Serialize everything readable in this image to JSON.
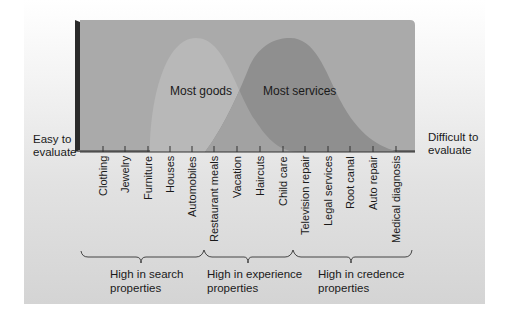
{
  "diagram": {
    "left_label": "Easy to\nevaluate",
    "right_label": "Difficult to\nevaluate",
    "curves": [
      {
        "label": "Most goods",
        "color": "#b8b8b8"
      },
      {
        "label": "Most services",
        "color": "#8f8f8f"
      }
    ],
    "box_color": "#aaaaaa",
    "categories": [
      "Clothing",
      "Jewelry",
      "Furniture",
      "Houses",
      "Automobiles",
      "Restaurant meals",
      "Vacation",
      "Haircuts",
      "Child care",
      "Television repair",
      "Legal services",
      "Root canal",
      "Auto repair",
      "Medical diagnosis"
    ],
    "groups": [
      {
        "label": "High in search\nproperties"
      },
      {
        "label": "High in experience\nproperties"
      },
      {
        "label": "High in credence\nproperties"
      }
    ]
  }
}
